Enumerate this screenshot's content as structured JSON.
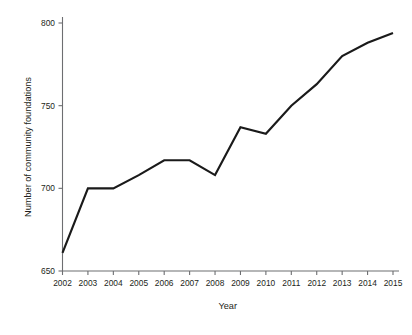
{
  "chart_data": {
    "type": "line",
    "title": "",
    "subtitle": "",
    "xlabel": "Year",
    "ylabel": "Number of community foundations",
    "categories": [
      "2002",
      "2003",
      "2004",
      "2005",
      "2006",
      "2007",
      "2008",
      "2009",
      "2010",
      "2011",
      "2012",
      "2013",
      "2014",
      "2015"
    ],
    "x": [
      2002,
      2003,
      2004,
      2005,
      2006,
      2007,
      2008,
      2009,
      2010,
      2011,
      2012,
      2013,
      2014,
      2015
    ],
    "values": [
      661,
      700,
      700,
      708,
      717,
      717,
      708,
      737,
      733,
      750,
      763,
      780,
      788,
      794
    ],
    "series": [
      {
        "name": "Number of community foundations",
        "values": [
          661,
          700,
          700,
          708,
          717,
          717,
          708,
          737,
          733,
          750,
          763,
          780,
          788,
          794
        ],
        "color": "#1a1a1a"
      }
    ],
    "xlim": [
      2002,
      2015
    ],
    "ylim": [
      650,
      800
    ],
    "ytick_labels": [
      "650",
      "700",
      "750",
      "800"
    ],
    "yticks": [
      650,
      700,
      750,
      800
    ],
    "xtick_labels": [
      "2002",
      "2003",
      "2004",
      "2005",
      "2006",
      "2007",
      "2008",
      "2009",
      "2010",
      "2011",
      "2012",
      "2013",
      "2014",
      "2015"
    ],
    "grid": false,
    "legend": false,
    "legend_position": "none",
    "annotations": [],
    "axis_color": "#6d6e71",
    "text_color": "#231f20",
    "background_color": "#ffffff"
  }
}
